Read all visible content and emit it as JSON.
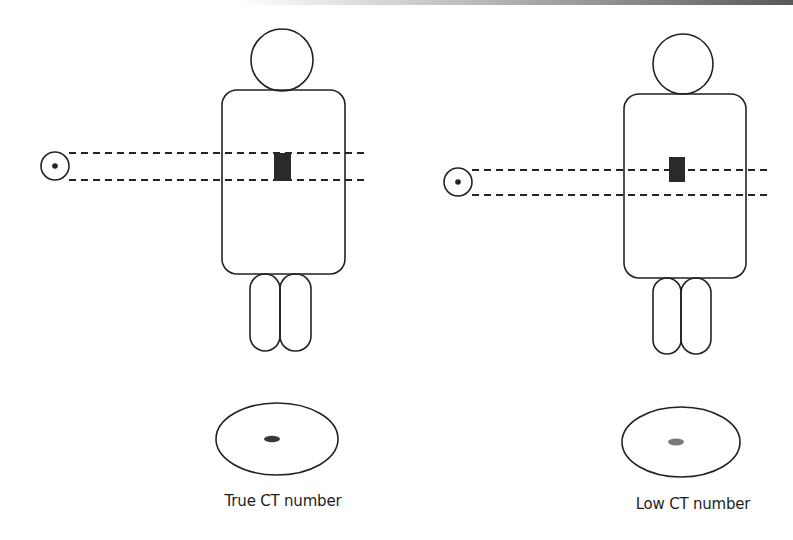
{
  "figure": {
    "panels": [
      {
        "id": "true",
        "label": "True CT number",
        "source": {
          "cx": 55,
          "cy": 166,
          "r": 14,
          "dot_r": 2.8
        },
        "beam": {
          "x1": 69,
          "x2": 367,
          "y_top": 153,
          "y_bottom": 180
        },
        "head": {
          "cx": 282,
          "cy": 60,
          "r": 31
        },
        "body": {
          "x": 222,
          "y": 90,
          "w": 123,
          "h": 184,
          "rx": 15
        },
        "lesion": {
          "x": 274,
          "y": 153,
          "w": 17,
          "h": 28,
          "color": "#2a2a2a"
        },
        "legs": [
          {
            "x": 250,
            "y": 274,
            "w": 30,
            "h": 77,
            "rx": 15
          },
          {
            "x": 280,
            "y": 274,
            "w": 31,
            "h": 77,
            "rx": 15
          }
        ],
        "slice": {
          "cx": 277,
          "cy": 439,
          "rx": 61,
          "ry": 36
        },
        "slice_spot": {
          "cx": 272,
          "cy": 439,
          "rx": 8,
          "ry": 3.2,
          "color": "#3a3a3a"
        },
        "label_pos": {
          "x": 283,
          "y": 492
        }
      },
      {
        "id": "low",
        "label": "Low CT number",
        "source": {
          "cx": 458,
          "cy": 182,
          "r": 14,
          "dot_r": 2.8
        },
        "beam": {
          "x1": 472,
          "x2": 767,
          "y_top": 170,
          "y_bottom": 195
        },
        "head": {
          "cx": 683,
          "cy": 64,
          "r": 30
        },
        "body": {
          "x": 624,
          "y": 94,
          "w": 122,
          "h": 184,
          "rx": 15
        },
        "lesion": {
          "x": 669,
          "y": 157,
          "w": 16,
          "h": 25,
          "color": "#2a2a2a"
        },
        "legs": [
          {
            "x": 653,
            "y": 278,
            "w": 28,
            "h": 76,
            "rx": 14
          },
          {
            "x": 681,
            "y": 278,
            "w": 30,
            "h": 76,
            "rx": 15
          }
        ],
        "slice": {
          "cx": 681,
          "cy": 442,
          "rx": 59,
          "ry": 35
        },
        "slice_spot": {
          "cx": 676,
          "cy": 442,
          "rx": 8,
          "ry": 3.4,
          "color": "#7a7a7a"
        },
        "label_pos": {
          "x": 693,
          "y": 495
        }
      }
    ],
    "labels": {
      "true_ct": "True CT number",
      "low_ct": "Low CT number"
    }
  }
}
